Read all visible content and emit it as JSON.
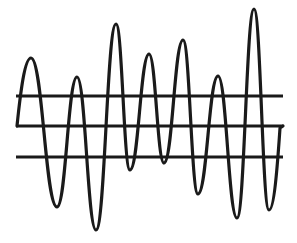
{
  "diagram": {
    "stroke_color": "#1a1a1a",
    "background_color": "#ffffff",
    "reference_lines": [
      {
        "name": "upper",
        "y": 96,
        "x_start": 16,
        "x_end": 283
      },
      {
        "name": "middle",
        "y": 126,
        "x_start": 16,
        "x_end": 283
      },
      {
        "name": "lower",
        "y": 157,
        "x_start": 16,
        "x_end": 283
      }
    ],
    "wave": {
      "start": [
        17,
        126
      ],
      "extrema": [
        {
          "type": "peak",
          "x": 31,
          "y": 58
        },
        {
          "type": "trough",
          "x": 57,
          "y": 207
        },
        {
          "type": "peak",
          "x": 77,
          "y": 77
        },
        {
          "type": "trough",
          "x": 96,
          "y": 230
        },
        {
          "type": "peak",
          "x": 116,
          "y": 24
        },
        {
          "type": "trough",
          "x": 130,
          "y": 170
        },
        {
          "type": "peak",
          "x": 149,
          "y": 54
        },
        {
          "type": "trough",
          "x": 164,
          "y": 163
        },
        {
          "type": "peak",
          "x": 183,
          "y": 40
        },
        {
          "type": "trough",
          "x": 198,
          "y": 194
        },
        {
          "type": "peak",
          "x": 218,
          "y": 76
        },
        {
          "type": "trough",
          "x": 237,
          "y": 218
        },
        {
          "type": "peak",
          "x": 254,
          "y": 9
        },
        {
          "type": "trough",
          "x": 269,
          "y": 210
        }
      ],
      "end": [
        280,
        128
      ]
    }
  }
}
